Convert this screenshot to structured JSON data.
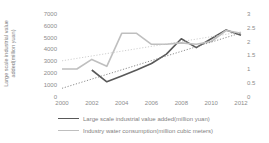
{
  "chart_data": {
    "type": "line",
    "title": "",
    "grid": false,
    "legend_position": "bottom-left",
    "y_left_label_lines": [
      "Large scale industrial value",
      "added(million yuan)"
    ],
    "y_left_ticks": [
      "7000",
      "6000",
      "5000",
      "4000",
      "3000",
      "2000",
      "1000",
      "0"
    ],
    "y_right_ticks": [
      "3",
      "2.5",
      "2",
      "1.5",
      "1",
      "0.5",
      "0"
    ],
    "x_ticks": [
      "2000",
      "2002",
      "2004",
      "2006",
      "2008",
      "2010",
      "2012"
    ],
    "axes": {
      "x": {
        "min": 2000,
        "max": 2012
      },
      "left": {
        "min": 0,
        "max": 7000
      },
      "right": {
        "min": 0,
        "max": 3
      }
    },
    "series": [
      {
        "name": "Large scale industrial value added(million yuan)",
        "axis": "left",
        "style": "solid",
        "color": "#595959",
        "width": 1.6,
        "x": [
          2002,
          2003,
          2004,
          2005,
          2006,
          2007,
          2008,
          2009,
          2010,
          2011,
          2012
        ],
        "y": [
          2250,
          1250,
          1750,
          2250,
          2800,
          3600,
          4900,
          4150,
          4900,
          5650,
          5200
        ]
      },
      {
        "name": "Industry water consumption(million cubic meters)",
        "axis": "right",
        "style": "solid",
        "color": "#bfbfbf",
        "width": 1.6,
        "x": [
          2000,
          2001,
          2002,
          2003,
          2004,
          2005,
          2006,
          2007,
          2008,
          2009,
          2010,
          2011,
          2012
        ],
        "y": [
          1.0,
          1.0,
          1.35,
          1.1,
          2.3,
          2.3,
          1.9,
          1.9,
          1.95,
          1.9,
          2.0,
          2.4,
          2.3
        ]
      },
      {
        "name": "Linear trend of industrial value added",
        "axis": "left",
        "style": "dotted",
        "color": "#808080",
        "width": 0.9,
        "x": [
          2000,
          2012
        ],
        "y": [
          700,
          5400
        ]
      },
      {
        "name": "Linear trend of industry water consumption",
        "axis": "right",
        "style": "dotted",
        "color": "#c9c9c9",
        "width": 0.9,
        "x": [
          2000,
          2012
        ],
        "y": [
          1.3,
          2.35
        ]
      }
    ],
    "legend": [
      {
        "label": "Large scale industrial value added(million yuan)",
        "color": "#595959"
      },
      {
        "label": "Industry water consumption(million cubic meters)",
        "color": "#bfbfbf"
      }
    ]
  }
}
